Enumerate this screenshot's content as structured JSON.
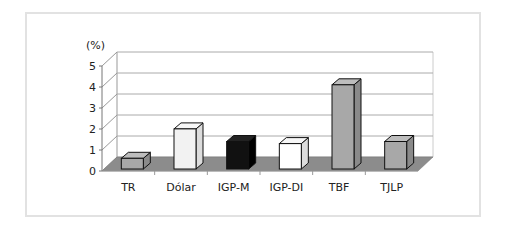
{
  "chart_data": {
    "type": "bar",
    "title": "",
    "ylabel": "(%)",
    "xlabel": "",
    "categories": [
      "TR",
      "Dólar",
      "IGP-M",
      "IGP-DI",
      "TBF",
      "TJLP"
    ],
    "values": [
      0.7,
      2.1,
      1.5,
      1.4,
      4.2,
      1.5
    ],
    "colors": [
      "#a8a8a8",
      "#f2f2f2",
      "#111111",
      "#ffffff",
      "#a8a8a8",
      "#a8a8a8"
    ],
    "yticks": [
      "0",
      "1",
      "2",
      "3",
      "4",
      "5"
    ],
    "ylim": [
      0,
      5
    ],
    "grid": true,
    "style": "3d-column",
    "floor_color": "#8c8c8c"
  }
}
